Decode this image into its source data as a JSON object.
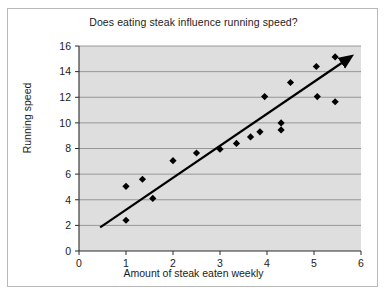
{
  "chart_data": {
    "type": "scatter",
    "title": "Does eating steak influence running speed?",
    "xlabel": "Amount of steak eaten weekly",
    "ylabel": "Running speed",
    "xlim": [
      0,
      6
    ],
    "ylim": [
      0,
      16
    ],
    "xticks": [
      0,
      1,
      2,
      3,
      4,
      5,
      6
    ],
    "yticks": [
      0,
      2,
      4,
      6,
      8,
      10,
      12,
      14,
      16
    ],
    "grid": "horizontal",
    "legend": "none",
    "plot_background": "#dedede",
    "marker": "diamond",
    "marker_color": "#000000",
    "points": [
      {
        "x": 1.0,
        "y": 2.4
      },
      {
        "x": 1.0,
        "y": 5.05
      },
      {
        "x": 1.35,
        "y": 5.6
      },
      {
        "x": 1.57,
        "y": 4.1
      },
      {
        "x": 2.0,
        "y": 7.05
      },
      {
        "x": 2.5,
        "y": 7.65
      },
      {
        "x": 3.0,
        "y": 7.95
      },
      {
        "x": 3.35,
        "y": 8.4
      },
      {
        "x": 3.65,
        "y": 8.9
      },
      {
        "x": 3.85,
        "y": 9.3
      },
      {
        "x": 3.95,
        "y": 12.05
      },
      {
        "x": 4.3,
        "y": 10.0
      },
      {
        "x": 4.3,
        "y": 9.45
      },
      {
        "x": 4.5,
        "y": 13.15
      },
      {
        "x": 5.05,
        "y": 14.4
      },
      {
        "x": 5.07,
        "y": 12.05
      },
      {
        "x": 5.45,
        "y": 15.15
      },
      {
        "x": 5.45,
        "y": 11.65
      }
    ],
    "trendline": {
      "type": "arrow",
      "x0": 0.45,
      "y0": 1.85,
      "x1": 5.62,
      "y1": 14.75,
      "color": "#000000"
    }
  }
}
